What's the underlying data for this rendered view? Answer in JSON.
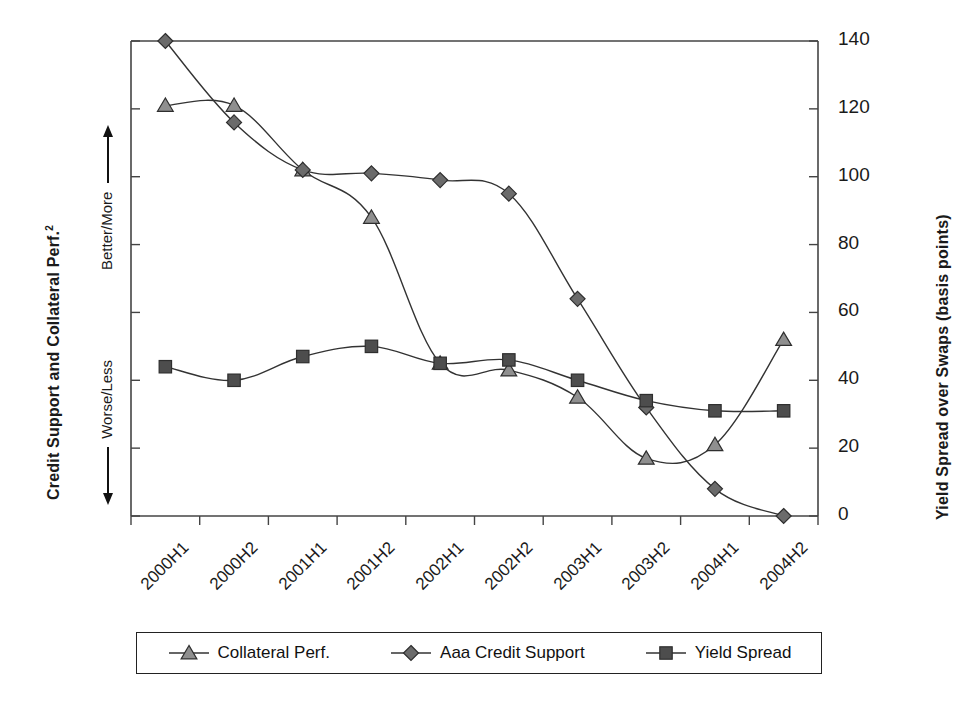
{
  "chart": {
    "type": "line",
    "left_axis": {
      "title": "Credit Support and Collateral Perf.",
      "title_superscript": "2",
      "direction_up": "Better/More",
      "direction_down": "Worse/Less"
    },
    "right_axis": {
      "title": "Yield Spread over Swaps (basis points)",
      "ticks": [
        "0",
        "20",
        "40",
        "60",
        "80",
        "100",
        "120",
        "140"
      ]
    },
    "x_axis": {
      "categories": [
        "2000H1",
        "2000H2",
        "2001H1",
        "2001H2",
        "2002H1",
        "2002H2",
        "2003H1",
        "2003H2",
        "2004H1",
        "2004H2"
      ]
    },
    "legend": [
      {
        "label": "Collateral Perf.",
        "marker": "triangle-marker",
        "color": "#8f8f8f"
      },
      {
        "label": "Aaa Credit Support",
        "marker": "diamond-marker",
        "color": "#6b6b6b"
      },
      {
        "label": "Yield Spread",
        "marker": "square-marker",
        "color": "#4d4d4d"
      }
    ]
  },
  "chart_data": {
    "type": "line",
    "title": "",
    "xlabel": "",
    "ylabel": "Credit Support and Collateral Perf.",
    "y2label": "Yield Spread over Swaps (basis points)",
    "ylim": [
      0,
      140
    ],
    "yticks": [
      0,
      20,
      40,
      60,
      80,
      100,
      120,
      140
    ],
    "grid": false,
    "legend_position": "bottom",
    "categories": [
      "2000H1",
      "2000H2",
      "2001H1",
      "2001H2",
      "2002H1",
      "2002H2",
      "2003H1",
      "2003H2",
      "2004H1",
      "2004H2"
    ],
    "series": [
      {
        "name": "Collateral Perf.",
        "marker": "triangle",
        "values": [
          121,
          121,
          102,
          88,
          45,
          43,
          35,
          17,
          21,
          52
        ]
      },
      {
        "name": "Aaa Credit Support",
        "marker": "diamond",
        "values": [
          140,
          116,
          102,
          101,
          99,
          95,
          64,
          32,
          8,
          0
        ]
      },
      {
        "name": "Yield Spread",
        "marker": "square",
        "values": [
          44,
          40,
          47,
          50,
          45,
          46,
          40,
          34,
          31,
          31
        ]
      }
    ]
  }
}
